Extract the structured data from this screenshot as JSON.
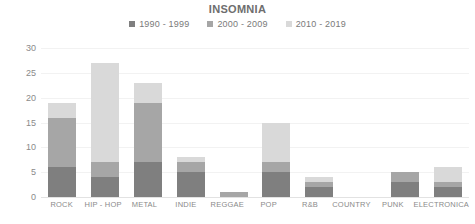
{
  "chart_data": {
    "type": "bar",
    "subtype": "stacked-bar",
    "title": "INSOMNIA",
    "xlabel": "",
    "ylabel": "",
    "ylim": [
      0,
      30
    ],
    "yticks": [
      0,
      5,
      10,
      15,
      20,
      25,
      30
    ],
    "ytick_labels": [
      "0",
      "5",
      "10",
      "15",
      "20",
      "25",
      "30"
    ],
    "grid": true,
    "legend_position": "top-center",
    "categories": [
      "ROCK",
      "HIP - HOP",
      "METAL",
      "INDIE",
      "REGGAE",
      "POP",
      "R&B",
      "COUNTRY",
      "PUNK",
      "ELECTRONICA"
    ],
    "series": [
      {
        "name": "1990 - 1999",
        "color": "#7f7f7f",
        "values": [
          6,
          4,
          7,
          5,
          0,
          5,
          2,
          0,
          3,
          2
        ]
      },
      {
        "name": "2000 - 2009",
        "color": "#a6a6a6",
        "values": [
          10,
          3,
          12,
          2,
          1,
          2,
          1,
          0,
          2,
          1
        ]
      },
      {
        "name": "2010 - 2019",
        "color": "#d9d9d9",
        "values": [
          3,
          20,
          4,
          1,
          0,
          8,
          1,
          0,
          0,
          3
        ]
      }
    ],
    "totals": [
      19,
      27,
      23,
      8,
      1,
      15,
      4,
      0,
      5,
      6
    ]
  }
}
